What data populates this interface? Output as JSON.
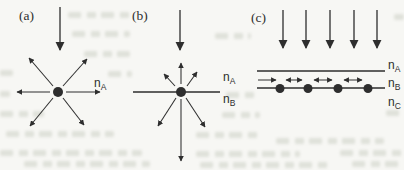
{
  "colors": {
    "background": "#f7f7f4",
    "ink": "#2e2e2e",
    "bleed": "#c2c6ba"
  },
  "figure": {
    "panel_a": {
      "label": "(a)",
      "media_labels": [
        {
          "base": "n",
          "sub": "A"
        }
      ]
    },
    "panel_b": {
      "label": "(b)",
      "media_labels": [
        {
          "base": "n",
          "sub": "A"
        },
        {
          "base": "n",
          "sub": "B"
        }
      ]
    },
    "panel_c": {
      "label": "(c)",
      "media_labels": [
        {
          "base": "n",
          "sub": "A"
        },
        {
          "base": "n",
          "sub": "B"
        },
        {
          "base": "n",
          "sub": "C"
        }
      ]
    }
  }
}
